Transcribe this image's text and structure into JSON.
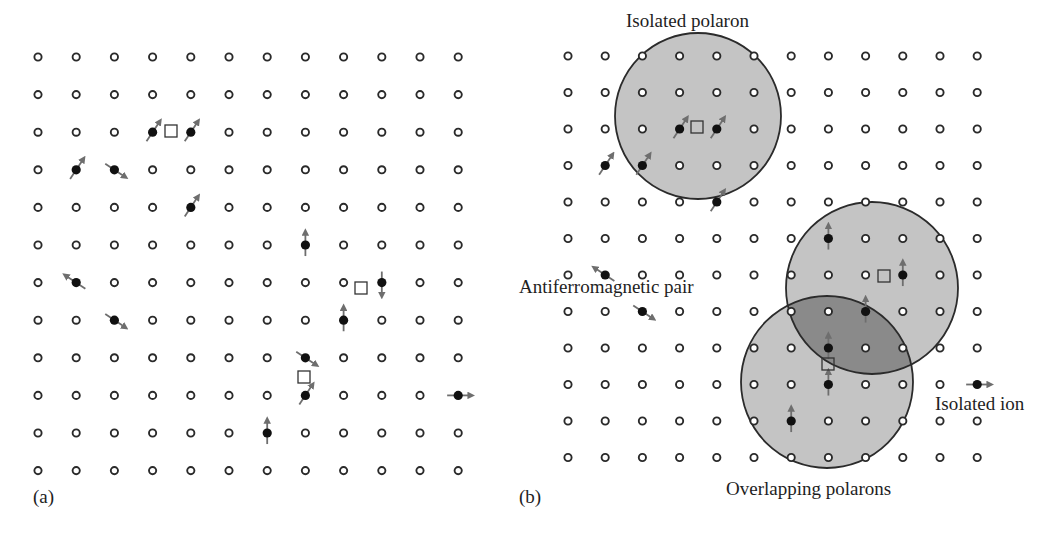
{
  "figure": {
    "panels": [
      {
        "id": "a",
        "label": "(a)",
        "grid": {
          "cols": 12,
          "rows": 12,
          "x0": 38,
          "dx": 38.2,
          "y0": 57,
          "dy": 37.6
        },
        "magnetic_ions": [
          {
            "row": 2,
            "col": 3,
            "spin": "up-right"
          },
          {
            "row": 2,
            "col": 4,
            "spin": "up-right"
          },
          {
            "row": 3,
            "col": 1,
            "spin": "up-right"
          },
          {
            "row": 3,
            "col": 2,
            "spin": "down-right"
          },
          {
            "row": 4,
            "col": 4,
            "spin": "up-right"
          },
          {
            "row": 5,
            "col": 7,
            "spin": "up"
          },
          {
            "row": 6,
            "col": 1,
            "spin": "up-left"
          },
          {
            "row": 6,
            "col": 9,
            "spin": "down"
          },
          {
            "row": 7,
            "col": 2,
            "spin": "down-right"
          },
          {
            "row": 7,
            "col": 8,
            "spin": "up"
          },
          {
            "row": 8,
            "col": 7,
            "spin": "down-right"
          },
          {
            "row": 9,
            "col": 7,
            "spin": "up-right"
          },
          {
            "row": 9,
            "col": 11,
            "spin": "right"
          },
          {
            "row": 10,
            "col": 6,
            "spin": "up"
          }
        ],
        "carriers": [
          {
            "x": 171,
            "y": 131
          },
          {
            "x": 361,
            "y": 288
          },
          {
            "x": 304,
            "y": 377
          }
        ],
        "polarons": []
      },
      {
        "id": "b",
        "label": "(b)",
        "grid": {
          "cols": 12,
          "rows": 12,
          "x0": 568,
          "dx": 37.2,
          "y0": 56,
          "dy": 36.5
        },
        "magnetic_ions": [
          {
            "row": 2,
            "col": 3,
            "spin": "up-right"
          },
          {
            "row": 2,
            "col": 4,
            "spin": "up-right"
          },
          {
            "row": 3,
            "col": 1,
            "spin": "up-right"
          },
          {
            "row": 3,
            "col": 2,
            "spin": "up-right"
          },
          {
            "row": 4,
            "col": 4,
            "spin": "up-right"
          },
          {
            "row": 5,
            "col": 7,
            "spin": "up"
          },
          {
            "row": 6,
            "col": 1,
            "spin": "up-left"
          },
          {
            "row": 6,
            "col": 9,
            "spin": "up"
          },
          {
            "row": 7,
            "col": 2,
            "spin": "down-right"
          },
          {
            "row": 7,
            "col": 8,
            "spin": "up"
          },
          {
            "row": 8,
            "col": 7,
            "spin": "up"
          },
          {
            "row": 9,
            "col": 7,
            "spin": "up"
          },
          {
            "row": 9,
            "col": 11,
            "spin": "right"
          },
          {
            "row": 10,
            "col": 6,
            "spin": "up"
          }
        ],
        "carriers": [
          {
            "x": 697,
            "y": 127
          },
          {
            "x": 884,
            "y": 276
          },
          {
            "x": 828,
            "y": 364
          }
        ],
        "polarons": [
          {
            "name": "isolated-polaron",
            "cx": 698,
            "cy": 116,
            "r": 83
          },
          {
            "name": "overlapping-polaron-upper",
            "cx": 872,
            "cy": 288,
            "r": 86
          },
          {
            "name": "overlapping-polaron-lower",
            "cx": 827,
            "cy": 382,
            "r": 86
          }
        ],
        "annotations": {
          "isolated_polaron": "Isolated polaron",
          "antiferromagnetic_pair": "Antiferromagnetic pair",
          "overlapping_polarons": "Overlapping polarons",
          "isolated_ion": "Isolated ion"
        }
      }
    ],
    "colors": {
      "lattice_site": "#2a2a2a",
      "ion": "#111111",
      "spin_arrow": "#6e6e6e",
      "polaron_fill": "#c4c4c4",
      "overlap_fill": "#8a8a8a",
      "polaron_stroke": "#2b2b2b",
      "carrier_stroke": "#333333"
    }
  }
}
